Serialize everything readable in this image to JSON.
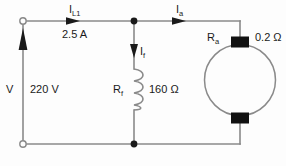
{
  "diagram": {
    "background_color": "#fdfdfd",
    "wire_color": "#7a7a7a",
    "text_color": "#1a1a1a",
    "brush_color": "#111111"
  },
  "labels": {
    "line_current_symbol": "I",
    "line_current_subscript": "L1",
    "line_current_value": "2.5 A",
    "armature_current_symbol": "I",
    "armature_current_subscript": "a",
    "field_current_symbol": "I",
    "field_current_subscript": "f",
    "supply_symbol": "V",
    "supply_value": "220 V",
    "field_resistor_symbol": "R",
    "field_resistor_subscript": "f",
    "field_resistor_value": "160 Ω",
    "armature_resistor_symbol": "R",
    "armature_resistor_subscript": "a",
    "armature_resistor_value": "0.2 Ω"
  },
  "components": {
    "terminal_top_left": "open-terminal",
    "terminal_bottom_left": "open-terminal",
    "node_top": "junction-dot",
    "node_bottom": "junction-dot",
    "field_winding": "coil-resistor",
    "armature": "motor-circle",
    "brush_top": "commutator-brush",
    "brush_bottom": "commutator-brush",
    "supply_arrow": "up-arrow",
    "line_current_arrow": "right-arrow",
    "armature_current_arrow": "right-arrow",
    "field_current_arrow": "down-arrow"
  }
}
